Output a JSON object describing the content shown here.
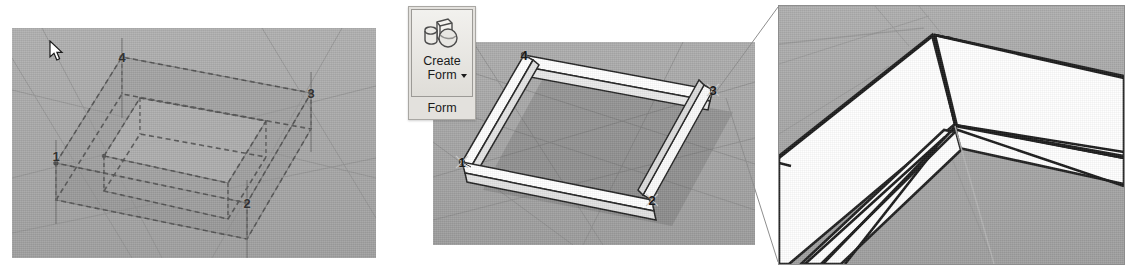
{
  "figure": {
    "kind": "cad-sequence",
    "panel_count": 3,
    "background_color": "#ffffff",
    "viewport_color": "#a8a8a8",
    "geometry_color": "#ffffff",
    "outline_color": "#222222",
    "label_color": "#1a1a1a"
  },
  "panels": {
    "left": {
      "name": "closed-profile-selection-view",
      "state_label": "",
      "vertices": [
        {
          "label": "1",
          "x": 44,
          "y": 135
        },
        {
          "label": "2",
          "x": 235,
          "y": 175
        },
        {
          "label": "3",
          "x": 299,
          "y": 65
        },
        {
          "label": "4",
          "x": 110,
          "y": 29
        }
      ]
    },
    "middle": {
      "name": "created-form-solid-view",
      "vertices": [
        {
          "label": "1",
          "x": 29,
          "y": 120
        },
        {
          "label": "2",
          "x": 219,
          "y": 158
        },
        {
          "label": "3",
          "x": 280,
          "y": 48
        },
        {
          "label": "4",
          "x": 91,
          "y": 13
        }
      ]
    },
    "right": {
      "name": "mitered-corner-detail-view",
      "caption": ""
    }
  },
  "ribbon": {
    "group_label": "Form",
    "button": {
      "name": "create-form-button",
      "label_line_1": "Create",
      "label_line_2": "Form",
      "icon": "3d-solids-icon",
      "has_dropdown": true,
      "state": "hover"
    }
  },
  "cursor": {
    "icon": "arrow-cursor",
    "x": 457,
    "y": 46
  }
}
